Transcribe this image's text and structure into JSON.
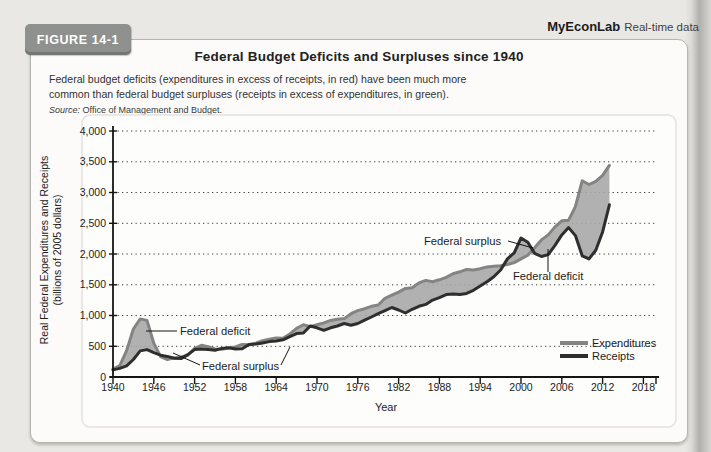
{
  "page": {
    "badge": "FIGURE 14-1",
    "brand": {
      "name": "MyEconLab",
      "tagline": "Real-time data"
    },
    "title": "Federal Budget Deficits and Surpluses since 1940",
    "caption": {
      "line1": "Federal budget deficits (expenditures in excess of receipts, in red) have been much more",
      "line2": "common than federal budget surpluses (receipts in excess of expenditures, in green)."
    },
    "source": {
      "label": "Source:",
      "text": "Office of Management and Budget."
    }
  },
  "colors": {
    "badge_bg": "#8e918e",
    "expenditures_line": "#848484",
    "receipts_line": "#2e2e2e",
    "deficit_fill": "#a9a9a9",
    "axis": "#151515",
    "grid": "#3f3f3f",
    "panel_bg": "#fdfdfb",
    "panel_border": "#e4e2de"
  },
  "chart_data": {
    "type": "area",
    "title": "",
    "xlabel": "Year",
    "ylabel": "Real Federal Expenditures and Receipts",
    "ylabel_line2": "(billions of 2005 dollars)",
    "xlim": [
      1940,
      2018
    ],
    "ylim": [
      0,
      4000
    ],
    "x_ticks": [
      1940,
      1946,
      1952,
      1958,
      1964,
      1970,
      1976,
      1982,
      1988,
      1994,
      2000,
      2006,
      2012,
      2018
    ],
    "y_ticks": [
      0,
      500,
      1000,
      1500,
      2000,
      2500,
      3000,
      3500,
      4000
    ],
    "y_tick_labels": [
      "0",
      "500",
      "1,000",
      "1,500",
      "2,000",
      "2,500",
      "3,000",
      "3,500",
      "4,000"
    ],
    "grid": "horizontal-dotted",
    "legend_position": "lower-right",
    "years": [
      1940,
      1941,
      1942,
      1943,
      1944,
      1945,
      1946,
      1947,
      1948,
      1949,
      1950,
      1951,
      1952,
      1953,
      1954,
      1955,
      1956,
      1957,
      1958,
      1959,
      1960,
      1961,
      1962,
      1963,
      1964,
      1965,
      1966,
      1967,
      1968,
      1969,
      1970,
      1971,
      1972,
      1973,
      1974,
      1975,
      1976,
      1977,
      1978,
      1979,
      1980,
      1981,
      1982,
      1983,
      1984,
      1985,
      1986,
      1987,
      1988,
      1989,
      1990,
      1991,
      1992,
      1993,
      1994,
      1995,
      1996,
      1997,
      1998,
      1999,
      2000,
      2001,
      2002,
      2003,
      2004,
      2005,
      2006,
      2007,
      2008,
      2009,
      2010,
      2011,
      2012,
      2013
    ],
    "series": [
      {
        "name": "Expenditures",
        "values": [
          130,
          185,
          430,
          780,
          945,
          920,
          550,
          330,
          285,
          310,
          325,
          355,
          465,
          515,
          495,
          455,
          450,
          470,
          490,
          530,
          525,
          550,
          590,
          615,
          635,
          630,
          700,
          790,
          850,
          820,
          850,
          880,
          920,
          940,
          950,
          1030,
          1080,
          1110,
          1150,
          1170,
          1280,
          1330,
          1380,
          1440,
          1450,
          1530,
          1570,
          1550,
          1580,
          1620,
          1680,
          1710,
          1750,
          1740,
          1760,
          1790,
          1800,
          1810,
          1830,
          1860,
          1920,
          1980,
          2100,
          2230,
          2310,
          2440,
          2540,
          2550,
          2770,
          3190,
          3130,
          3180,
          3280,
          3440
        ]
      },
      {
        "name": "Receipts",
        "values": [
          115,
          140,
          180,
          285,
          425,
          445,
          395,
          355,
          335,
          305,
          300,
          365,
          445,
          455,
          445,
          435,
          465,
          475,
          455,
          460,
          530,
          535,
          555,
          575,
          585,
          605,
          655,
          705,
          715,
          830,
          800,
          760,
          800,
          830,
          870,
          840,
          870,
          925,
          975,
          1030,
          1080,
          1130,
          1090,
          1040,
          1100,
          1150,
          1180,
          1250,
          1290,
          1340,
          1350,
          1340,
          1360,
          1410,
          1480,
          1550,
          1630,
          1740,
          1920,
          2020,
          2260,
          2190,
          2010,
          1960,
          1990,
          2140,
          2310,
          2430,
          2300,
          1970,
          1920,
          2060,
          2360,
          2800
        ]
      }
    ],
    "annotations": [
      {
        "text": "Federal deficit",
        "x": 146,
        "y": 225,
        "leaders": [
          [
            143,
            221,
            112,
            221
          ]
        ]
      },
      {
        "text": "Federal surplus",
        "x": 168,
        "y": 260,
        "leaders": [
          [
            166,
            255,
            139,
            243
          ],
          [
            247,
            255,
            256,
            237
          ]
        ]
      },
      {
        "text": "Federal surplus",
        "x": 390,
        "y": 135,
        "leaders": [
          [
            474,
            131,
            499,
            138
          ]
        ]
      },
      {
        "text": "Federal deficit",
        "x": 479,
        "y": 170,
        "leaders": [
          [
            514,
            162,
            514,
            139
          ]
        ]
      }
    ]
  }
}
